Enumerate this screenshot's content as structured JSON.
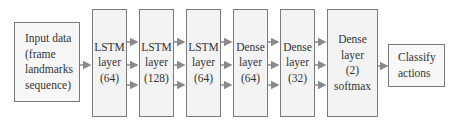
{
  "diagram": {
    "input": {
      "lines": [
        "Input data",
        "(frame",
        "landmarks",
        "sequence)"
      ]
    },
    "layers": [
      {
        "lines": [
          "LSTM",
          "layer",
          "(64)"
        ]
      },
      {
        "lines": [
          "LSTM",
          "layer",
          "(128)"
        ]
      },
      {
        "lines": [
          "LSTM",
          "layer",
          "(64)"
        ]
      },
      {
        "lines": [
          "Dense",
          "layer",
          "(64)"
        ]
      },
      {
        "lines": [
          "Dense",
          "layer",
          "(32)"
        ]
      },
      {
        "lines": [
          "Dense",
          "layer",
          "(2)",
          "softmax"
        ]
      }
    ],
    "output": {
      "lines": [
        "Classify",
        "actions"
      ]
    },
    "colors": {
      "border": "#7a7a7a",
      "fill": "#f3f3f3",
      "arrow": "#8a8a8a"
    }
  }
}
